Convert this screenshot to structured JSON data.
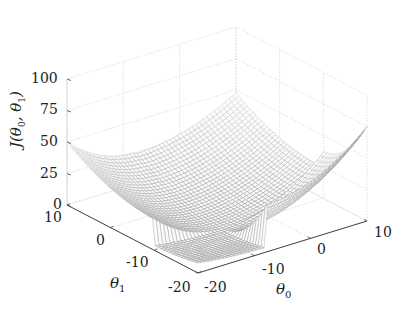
{
  "chart_data": {
    "type": "surface",
    "title": "",
    "xlabel": "θ0",
    "ylabel": "θ1",
    "zlabel": "J(θ0,θ1)",
    "x_range": [
      -20,
      10
    ],
    "y_range": [
      -20,
      10
    ],
    "z_range": [
      0,
      100
    ],
    "x_ticks": [
      -20,
      -10,
      0,
      10
    ],
    "y_ticks": [
      -20,
      -10,
      0,
      10
    ],
    "z_ticks": [
      0,
      25,
      50,
      75,
      100
    ],
    "grid": true,
    "colormap": "grayscale",
    "surface_corner_values": {
      "theta0_-20_theta1_10": 50,
      "theta0_10_theta1_-20": 75,
      "theta0_10_theta1_10": 48,
      "theta0_-20_theta1_-20": 8
    },
    "minimum_region": {
      "theta0": -8,
      "theta1": -10,
      "J": 0
    }
  },
  "labels": {
    "z_axis": "J",
    "z_axis_args": "θ",
    "theta0_symbol": "θ",
    "theta0_sub": "0",
    "theta1_symbol": "θ",
    "theta1_sub": "1",
    "z_ticks": [
      "100",
      "75",
      "50",
      "25",
      "0"
    ],
    "theta1_ticks": [
      "10",
      "0",
      "-10",
      "-20"
    ],
    "theta0_ticks": [
      "-20",
      "-10",
      "0",
      "10"
    ]
  }
}
